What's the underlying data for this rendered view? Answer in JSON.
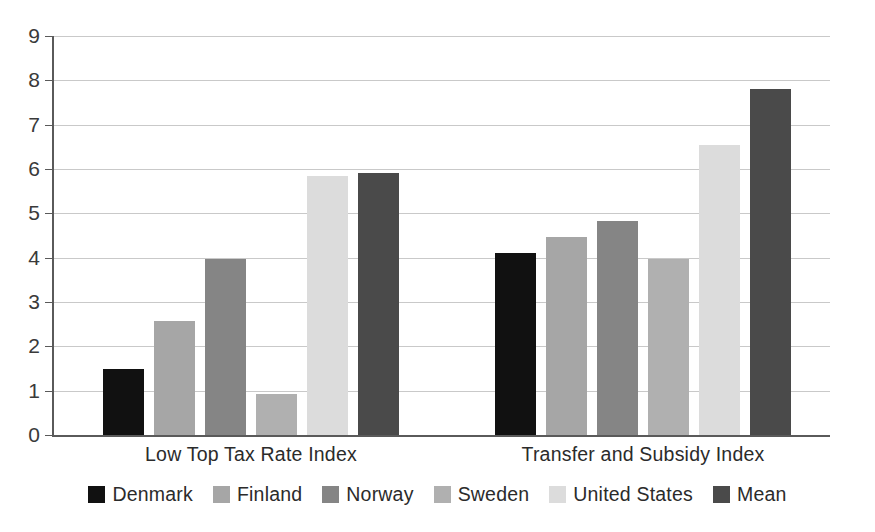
{
  "chart_data": {
    "type": "bar",
    "title": "",
    "subtitle": "",
    "xlabel": "",
    "ylabel": "",
    "ylim": [
      0,
      9
    ],
    "ytick_step": 1,
    "ytick_labels": [
      "9",
      "8",
      "7",
      "6",
      "5",
      "4",
      "3",
      "2",
      "1",
      "0"
    ],
    "grid": true,
    "legend_position": "bottom",
    "categories": [
      "Low Top Tax Rate Index",
      "Transfer and Subsidy Index"
    ],
    "series": [
      {
        "name": "Denmark",
        "color": "#111111",
        "values": [
          1.5,
          4.1
        ]
      },
      {
        "name": "Finland",
        "color": "#a6a6a6",
        "values": [
          2.57,
          4.47
        ]
      },
      {
        "name": "Norway",
        "color": "#858585",
        "values": [
          3.97,
          4.82
        ]
      },
      {
        "name": "Sweden",
        "color": "#b0b0b0",
        "values": [
          0.93,
          3.98
        ]
      },
      {
        "name": "United States",
        "color": "#dcdcdc",
        "values": [
          5.85,
          6.55
        ]
      },
      {
        "name": "Mean",
        "color": "#4a4a4a",
        "values": [
          5.9,
          7.8
        ]
      }
    ]
  },
  "legend": {
    "items": [
      {
        "label": "Denmark",
        "color": "#111111"
      },
      {
        "label": "Finland",
        "color": "#a6a6a6"
      },
      {
        "label": "Norway",
        "color": "#858585"
      },
      {
        "label": "Sweden",
        "color": "#b0b0b0"
      },
      {
        "label": "United States",
        "color": "#dcdcdc"
      },
      {
        "label": "Mean",
        "color": "#4a4a4a"
      }
    ]
  },
  "axes": {
    "y_ticks": [
      "9",
      "8",
      "7",
      "6",
      "5",
      "4",
      "3",
      "2",
      "1",
      "0"
    ],
    "x_categories": [
      "Low Top Tax Rate Index",
      "Transfer and Subsidy Index"
    ]
  }
}
